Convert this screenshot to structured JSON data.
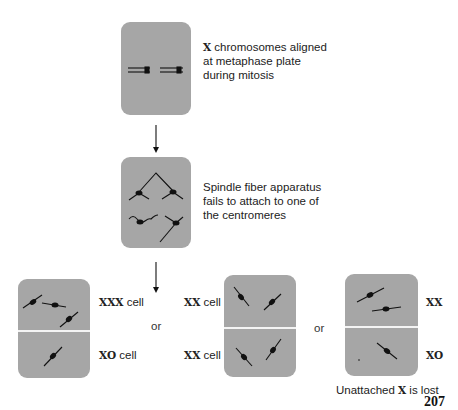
{
  "figure": {
    "step1": {
      "caption_bold": "X",
      "caption_lines": [
        "chromosomes aligned",
        "at metaphase plate",
        "during mitosis"
      ]
    },
    "step2": {
      "caption_lines": [
        "Spindle fiber apparatus",
        "fails to attach to one of",
        "the centromeres"
      ]
    },
    "outcomes": [
      {
        "top_label_bold": "XXX",
        "top_label_rest": " cell",
        "bottom_label_bold": "XO",
        "bottom_label_rest": " cell"
      },
      {
        "top_label_bold": "XX",
        "top_label_rest": " cell",
        "bottom_label_bold": "XX",
        "bottom_label_rest": " cell"
      },
      {
        "top_label_bold": "XX",
        "top_label_rest": "",
        "bottom_label_bold": "XO",
        "bottom_label_rest": ""
      }
    ],
    "separator": "or",
    "footnote": {
      "before": "Unattached ",
      "bold": "X",
      "after": " is lost"
    },
    "page_number": "207"
  }
}
